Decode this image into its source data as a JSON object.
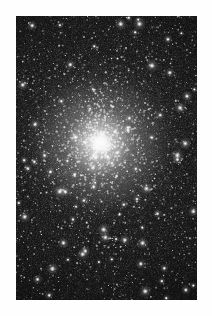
{
  "page": {
    "background_color": "#fefefe",
    "width": 212,
    "height": 316
  },
  "figure": {
    "type": "astronomical-image",
    "subject": "globular star cluster",
    "alt_text": "Dense globular star cluster with bright concentrated core on a dark sky background",
    "plate": {
      "x": 16,
      "y": 16,
      "width": 181,
      "height": 284,
      "background_color": "#070707",
      "border_color": "#0b0b0b"
    },
    "core": {
      "center_x": 100,
      "center_y": 143,
      "glow_color": "#ffffff",
      "halo_color": "#cfcfcf",
      "core_radius": 14,
      "halo_radius": 70
    },
    "sky_color": "#0a0a0a",
    "star_color": "#ffffff",
    "star_count_visible": 2400,
    "bright_foreground_star_count": 96
  }
}
